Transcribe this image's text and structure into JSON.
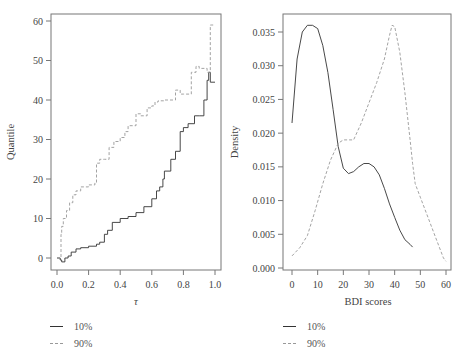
{
  "chart_data": [
    {
      "type": "line",
      "title": "",
      "xlabel": "τ",
      "ylabel": "Quantile",
      "xlim": [
        0.0,
        1.0
      ],
      "ylim": [
        -2,
        61
      ],
      "x_ticks": [
        "0.0",
        "0.2",
        "0.4",
        "0.6",
        "0.8",
        "1.0"
      ],
      "y_ticks": [
        "0",
        "10",
        "20",
        "30",
        "40",
        "50",
        "60"
      ],
      "grid": false,
      "legend_position": "below",
      "series": [
        {
          "name": "10%",
          "style": "solid",
          "x": [
            0.0,
            0.02,
            0.03,
            0.05,
            0.07,
            0.09,
            0.12,
            0.15,
            0.2,
            0.25,
            0.27,
            0.3,
            0.32,
            0.35,
            0.4,
            0.45,
            0.5,
            0.55,
            0.6,
            0.63,
            0.65,
            0.67,
            0.68,
            0.72,
            0.75,
            0.78,
            0.8,
            0.83,
            0.87,
            0.9,
            0.93,
            0.95,
            0.96,
            0.97,
            1.0
          ],
          "values": [
            0,
            -0.5,
            -1,
            0,
            0.5,
            1.5,
            2.3,
            2.6,
            3,
            3.5,
            4,
            6,
            7,
            9,
            10,
            10.5,
            11.5,
            13,
            15,
            17,
            18,
            20,
            22,
            25,
            27,
            32,
            33,
            34,
            36,
            36,
            40,
            45,
            47,
            44.5,
            44.5
          ]
        },
        {
          "name": "90%",
          "style": "dashed",
          "x": [
            0.0,
            0.02,
            0.025,
            0.03,
            0.04,
            0.06,
            0.08,
            0.1,
            0.12,
            0.15,
            0.2,
            0.24,
            0.25,
            0.27,
            0.3,
            0.33,
            0.36,
            0.4,
            0.43,
            0.45,
            0.5,
            0.53,
            0.57,
            0.6,
            0.62,
            0.64,
            0.68,
            0.75,
            0.78,
            0.8,
            0.85,
            0.88,
            0.9,
            0.95,
            0.97,
            0.98,
            1.0
          ],
          "values": [
            0,
            0,
            6,
            8,
            10,
            12,
            14,
            16,
            17,
            18,
            18.5,
            19,
            24,
            25,
            25,
            28,
            29.5,
            30.5,
            32,
            33.5,
            36.5,
            36,
            38,
            38.5,
            39.5,
            39.8,
            40,
            42.5,
            41.5,
            41.5,
            47,
            48.5,
            48,
            47,
            59,
            59,
            59
          ]
        }
      ]
    },
    {
      "type": "line",
      "title": "",
      "xlabel": "BDI scores",
      "ylabel": "Density",
      "xlim": [
        -3,
        63
      ],
      "ylim": [
        -0.0003,
        0.0375
      ],
      "x_ticks": [
        "0",
        "10",
        "20",
        "30",
        "40",
        "50",
        "60"
      ],
      "y_ticks": [
        "0.000",
        "0.005",
        "0.010",
        "0.015",
        "0.020",
        "0.025",
        "0.030",
        "0.035"
      ],
      "grid": false,
      "legend_position": "below",
      "series": [
        {
          "name": "10%",
          "style": "solid",
          "x": [
            0,
            2,
            4,
            6,
            8,
            10,
            12,
            14,
            16,
            18,
            20,
            22,
            24,
            26,
            28,
            30,
            32,
            34,
            36,
            38,
            40,
            42,
            44,
            46,
            47
          ],
          "values": [
            0.0215,
            0.031,
            0.035,
            0.036,
            0.036,
            0.0355,
            0.033,
            0.029,
            0.0235,
            0.018,
            0.0148,
            0.014,
            0.0143,
            0.015,
            0.0155,
            0.0155,
            0.015,
            0.0138,
            0.0118,
            0.0095,
            0.0075,
            0.0056,
            0.0042,
            0.0035,
            0.0031
          ]
        },
        {
          "name": "90%",
          "style": "dashed",
          "x": [
            0,
            3,
            6,
            9,
            12,
            15,
            18,
            20,
            22,
            24,
            27,
            30,
            33,
            36,
            38,
            39,
            40,
            42,
            44,
            46,
            47,
            48,
            50,
            53,
            56,
            59,
            60
          ],
          "values": [
            0.0018,
            0.003,
            0.0048,
            0.0085,
            0.0125,
            0.016,
            0.0185,
            0.019,
            0.019,
            0.019,
            0.0215,
            0.0245,
            0.0275,
            0.031,
            0.0345,
            0.036,
            0.0358,
            0.032,
            0.026,
            0.019,
            0.0155,
            0.0125,
            0.0105,
            0.0075,
            0.0045,
            0.0015,
            0.001
          ]
        }
      ]
    }
  ],
  "legends": [
    {
      "items": [
        {
          "label": "10%",
          "style": "solid"
        },
        {
          "label": "90%",
          "style": "dashed"
        }
      ]
    },
    {
      "items": [
        {
          "label": "10%",
          "style": "solid"
        },
        {
          "label": "90%",
          "style": "dashed"
        }
      ]
    }
  ]
}
